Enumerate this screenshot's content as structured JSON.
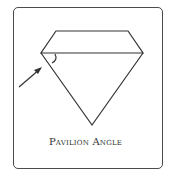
{
  "diagram": {
    "caption": "Pavilion Angle",
    "stroke_color": "#333333",
    "shape": "diamond-profile",
    "annotations": [
      "angle-arc-at-girdle-left",
      "arrow-pointing-to-angle"
    ]
  }
}
